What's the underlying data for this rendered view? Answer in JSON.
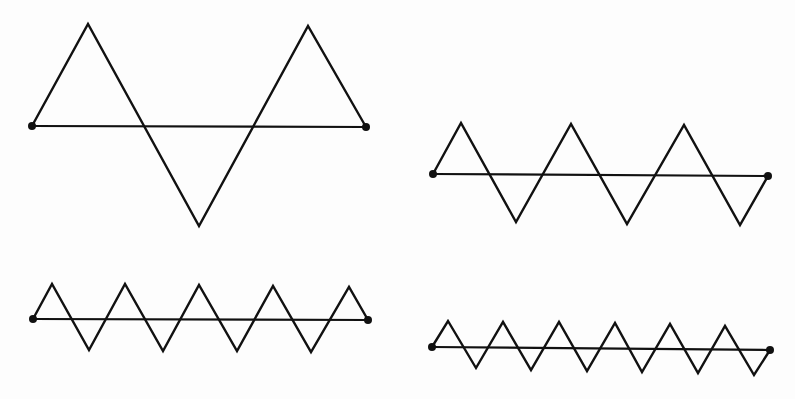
{
  "figure": {
    "width": 795,
    "height": 399,
    "stroke_color": "#111111",
    "background": "#fdfdfd"
  },
  "diagrams": [
    {
      "id": "zigzag-1",
      "label": "",
      "baseline": {
        "x1": 32,
        "y1": 126,
        "x2": 366,
        "y2": 127
      },
      "points": [
        [
          32,
          126
        ],
        [
          88,
          24
        ],
        [
          199,
          226
        ],
        [
          308,
          26
        ],
        [
          366,
          127
        ]
      ]
    },
    {
      "id": "zigzag-2",
      "label": "",
      "baseline": {
        "x1": 433,
        "y1": 174,
        "x2": 768,
        "y2": 176
      },
      "points": [
        [
          433,
          174
        ],
        [
          461,
          123
        ],
        [
          516,
          222
        ],
        [
          571,
          124
        ],
        [
          627,
          224
        ],
        [
          684,
          125
        ],
        [
          740,
          225
        ],
        [
          768,
          176
        ]
      ]
    },
    {
      "id": "zigzag-3",
      "label": "",
      "baseline": {
        "x1": 33,
        "y1": 319,
        "x2": 368,
        "y2": 320
      },
      "points": [
        [
          33,
          319
        ],
        [
          52,
          284
        ],
        [
          89,
          350
        ],
        [
          125,
          284
        ],
        [
          163,
          351
        ],
        [
          199,
          285
        ],
        [
          237,
          351
        ],
        [
          273,
          286
        ],
        [
          311,
          352
        ],
        [
          349,
          287
        ],
        [
          368,
          320
        ]
      ]
    },
    {
      "id": "zigzag-4",
      "label": "",
      "baseline": {
        "x1": 432,
        "y1": 347,
        "x2": 770,
        "y2": 350
      },
      "points": [
        [
          432,
          347
        ],
        [
          448,
          321
        ],
        [
          476,
          368
        ],
        [
          503,
          322
        ],
        [
          531,
          370
        ],
        [
          559,
          322
        ],
        [
          587,
          371
        ],
        [
          615,
          323
        ],
        [
          642,
          372
        ],
        [
          670,
          324
        ],
        [
          698,
          373
        ],
        [
          725,
          326
        ],
        [
          754,
          375
        ],
        [
          770,
          350
        ]
      ]
    }
  ]
}
